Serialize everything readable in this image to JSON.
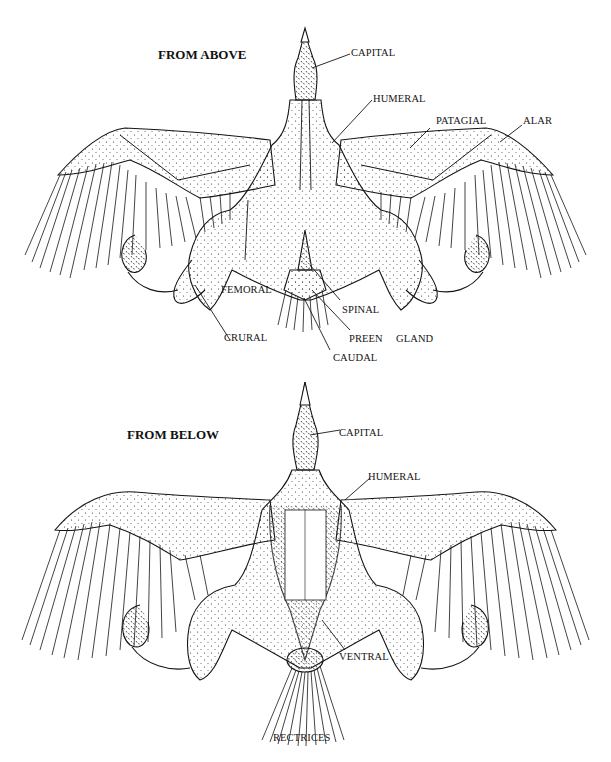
{
  "figure": {
    "colors": {
      "ink": "#151515",
      "background": "#ffffff",
      "stipple": "#2a2a2a"
    }
  },
  "top_view": {
    "title": "FROM ABOVE",
    "labels": {
      "capital": "CAPITAL",
      "humeral": "HUMERAL",
      "patagial": "PATAGIAL",
      "alar": "ALAR",
      "femoral": "FEMORAL",
      "spinal": "SPINAL",
      "crural": "CRURAL",
      "preen": "PREEN",
      "gland": "GLAND",
      "caudal": "CAUDAL"
    }
  },
  "bottom_view": {
    "title": "FROM BELOW",
    "labels": {
      "capital": "CAPITAL",
      "humeral": "HUMERAL",
      "ventral": "VENTRAL",
      "rectrices": "RECTRICES"
    }
  }
}
